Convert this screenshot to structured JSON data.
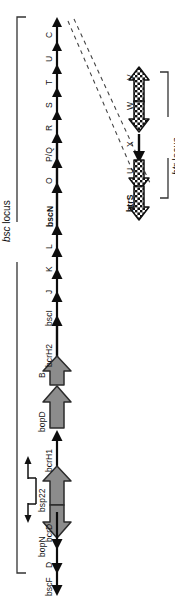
{
  "figure": {
    "background_color": "#ffffff",
    "ink_color": "#111111",
    "gray_arrow_fill": "#8c8c8c",
    "gray_arrow_stroke": "#2b2b2b"
  },
  "bsc_locus": {
    "label_italic": "bsc",
    "label_rest": " locus",
    "label_full": "bsc locus",
    "genes": [
      {
        "id": "bscF",
        "label": "bscF",
        "bold": false,
        "style": "thin",
        "direction": "down"
      },
      {
        "id": "D",
        "label": "D",
        "bold": false,
        "style": "thin",
        "direction": "down"
      },
      {
        "id": "bcrD",
        "label": "bcrD",
        "bold": false,
        "style": "thin",
        "direction": "down"
      },
      {
        "id": "bopN",
        "label": "bopN",
        "bold": false,
        "style": "thick",
        "direction": "down"
      },
      {
        "id": "bsp22",
        "label": "bsp22",
        "bold": false,
        "style": "thick",
        "direction": "up"
      },
      {
        "id": "bcrH1",
        "label": "bcrH1",
        "bold": false,
        "style": "thin",
        "direction": "up"
      },
      {
        "id": "bopD",
        "label": "bopD",
        "bold": false,
        "style": "thick",
        "direction": "up"
      },
      {
        "id": "B",
        "label": "B",
        "bold": false,
        "style": "thick",
        "direction": "up"
      },
      {
        "id": "bcrH2",
        "label": "bcrH2",
        "bold": false,
        "style": "thin",
        "direction": "up"
      },
      {
        "id": "bscI",
        "label": "bscI",
        "bold": false,
        "style": "thin",
        "direction": "up"
      },
      {
        "id": "J",
        "label": "J",
        "bold": false,
        "style": "thin",
        "direction": "up"
      },
      {
        "id": "K",
        "label": "K",
        "bold": false,
        "style": "thin",
        "direction": "up"
      },
      {
        "id": "L",
        "label": "L",
        "bold": false,
        "style": "thin",
        "direction": "up"
      },
      {
        "id": "bscN",
        "label": "bscN",
        "bold": true,
        "style": "thin",
        "direction": "up"
      },
      {
        "id": "O",
        "label": "O",
        "bold": false,
        "style": "thin",
        "direction": "up"
      },
      {
        "id": "PQ",
        "label": "P/Q",
        "bold": false,
        "style": "thin",
        "direction": "up"
      },
      {
        "id": "R",
        "label": "R",
        "bold": false,
        "style": "thin",
        "direction": "up"
      },
      {
        "id": "S",
        "label": "S",
        "bold": false,
        "style": "thin",
        "direction": "up"
      },
      {
        "id": "T",
        "label": "T",
        "bold": false,
        "style": "thin",
        "direction": "up"
      },
      {
        "id": "U",
        "label": "U",
        "bold": false,
        "style": "thin",
        "direction": "up"
      },
      {
        "id": "C",
        "label": "C",
        "bold": false,
        "style": "thin",
        "direction": "up"
      }
    ],
    "promoter": {
      "name": "bidirectional-promoter",
      "between": [
        "bopN",
        "bsp22"
      ]
    }
  },
  "btr_locus": {
    "label_italic": "btr",
    "label_rest": " locus",
    "label_full": "btr locus",
    "genes": [
      {
        "id": "btrS",
        "label": "btrS",
        "bold": true,
        "style": "hatch",
        "direction": "down"
      },
      {
        "id": "U",
        "label": "U",
        "bold": false,
        "style": "hatch",
        "direction": "down"
      },
      {
        "id": "X",
        "label": "X",
        "bold": false,
        "style": "thin",
        "direction": "down"
      },
      {
        "id": "W",
        "label": "W",
        "bold": false,
        "style": "hatch",
        "direction": "down"
      },
      {
        "id": "V",
        "label": "V",
        "bold": false,
        "style": "hatch",
        "direction": "up"
      }
    ]
  },
  "connector": {
    "name": "dashed-expansion-lines",
    "style": "dashed",
    "count": 2
  }
}
